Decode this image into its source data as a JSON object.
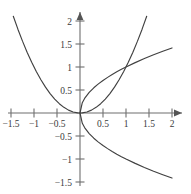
{
  "chart_data": {
    "type": "line",
    "title": "",
    "subtitle": "",
    "xlabel": "",
    "ylabel": "",
    "xlim": [
      -1.75,
      2.15
    ],
    "ylim": [
      -1.65,
      2.15
    ],
    "grid": false,
    "legend": "none",
    "annotations": [],
    "xticks": [
      -1.5,
      -1,
      -0.5,
      0.5,
      1,
      1.5,
      2
    ],
    "yticks": [
      -1.5,
      -1,
      -0.5,
      0.5,
      1,
      1.5,
      2
    ],
    "xtick_labels": [
      "−1.5",
      "−1",
      "−0.5",
      "0.5",
      "1",
      "1.5",
      "2"
    ],
    "ytick_labels": [
      "−1.5",
      "−1",
      "−0.5",
      "0.5",
      "1",
      "1.5",
      "2"
    ],
    "series": [
      {
        "name": "y = x squared",
        "expression": "y = x^2",
        "x": [
          -1.45,
          -1.35,
          -1.25,
          -1.15,
          -1.05,
          -0.95,
          -0.85,
          -0.75,
          -0.65,
          -0.55,
          -0.45,
          -0.35,
          -0.25,
          -0.15,
          -0.05,
          0,
          0.05,
          0.15,
          0.25,
          0.35,
          0.45,
          0.55,
          0.65,
          0.75,
          0.85,
          0.95,
          1.05,
          1.15,
          1.25,
          1.35,
          1.45
        ],
        "values": [
          2.1025,
          1.8225,
          1.5625,
          1.3225,
          1.1025,
          0.9025,
          0.7225,
          0.5625,
          0.4225,
          0.3025,
          0.2025,
          0.1225,
          0.0625,
          0.0225,
          0.0025,
          0,
          0.0025,
          0.0225,
          0.0625,
          0.1225,
          0.2025,
          0.3025,
          0.4225,
          0.5625,
          0.7225,
          0.9025,
          1.1025,
          1.3225,
          1.5625,
          1.8225,
          2.1025
        ]
      },
      {
        "name": "y = square root of x",
        "expression": "y = sqrt(x)",
        "x": [
          0,
          0.05,
          0.1,
          0.2,
          0.3,
          0.4,
          0.5,
          0.6,
          0.7,
          0.8,
          0.9,
          1.0,
          1.2,
          1.4,
          1.6,
          1.8,
          2.0
        ],
        "values": [
          0,
          0.2236,
          0.3162,
          0.4472,
          0.5477,
          0.6325,
          0.7071,
          0.7746,
          0.8367,
          0.8944,
          0.9487,
          1.0,
          1.0954,
          1.1832,
          1.2649,
          1.3416,
          1.4142
        ]
      },
      {
        "name": "y = negative square root of x",
        "expression": "y = -sqrt(x)",
        "x": [
          0,
          0.05,
          0.1,
          0.2,
          0.3,
          0.4,
          0.5,
          0.6,
          0.7,
          0.8,
          0.9,
          1.0,
          1.2,
          1.4,
          1.6,
          1.8,
          2.0
        ],
        "values": [
          0,
          -0.2236,
          -0.3162,
          -0.4472,
          -0.5477,
          -0.6325,
          -0.7071,
          -0.7746,
          -0.8367,
          -0.8944,
          -0.9487,
          -1.0,
          -1.0954,
          -1.1832,
          -1.2649,
          -1.3416,
          -1.4142
        ]
      }
    ],
    "intersection_points": [
      [
        0,
        0
      ],
      [
        1,
        1
      ]
    ],
    "colors": {
      "curve": "#404040",
      "axis": "#6e6e6e",
      "label": "#3a3a3a",
      "background": "#ffffff"
    }
  }
}
